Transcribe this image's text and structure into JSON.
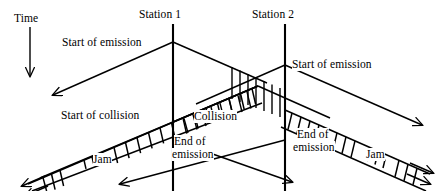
{
  "figure": {
    "type": "space-time-diagram",
    "axis": {
      "time_label": "Time",
      "time_arrow_direction": "down"
    },
    "stations": [
      {
        "id": "station-1",
        "label": "Station 1",
        "x": 173
      },
      {
        "id": "station-2",
        "label": "Station 2",
        "x": 285
      }
    ],
    "labels": {
      "start_of_emission_left": "Start of emission",
      "start_of_emission_right": "Start of emission",
      "start_of_collision": "Start of collision",
      "collision": "Collision",
      "end_of_emission_center_line1": "End of",
      "end_of_emission_center_line2": "emission",
      "end_of_emission_right_line1": "End of",
      "end_of_emission_right_line2": "emission",
      "jam_left": "Jam",
      "jam_right": "Jam"
    },
    "colors": {
      "stroke": "#000000",
      "background": "#ffffff",
      "hatch": "#000000"
    },
    "regions": [
      {
        "name": "collision-band",
        "hatch": "vertical",
        "between": [
          "station-1",
          "station-2"
        ]
      },
      {
        "name": "jam-band-left",
        "hatch": "vertical",
        "direction": "down-left"
      },
      {
        "name": "jam-band-right",
        "hatch": "vertical",
        "direction": "down-right"
      }
    ]
  }
}
